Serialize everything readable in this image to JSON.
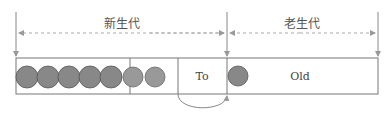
{
  "diagram": {
    "regions": {
      "young": {
        "label": "新生代"
      },
      "old": {
        "label": "老生代"
      }
    },
    "cells": {
      "eden": {
        "label": "",
        "objects": 5
      },
      "from": {
        "label": "",
        "objects": 2
      },
      "to": {
        "label": "To",
        "objects": 0
      },
      "old": {
        "label": "Old",
        "objects": 1
      }
    },
    "colors": {
      "object_fill": "#888888",
      "object_fill_light": "#999999",
      "line": "#666666",
      "dashed": "#aaaaaa"
    },
    "arrows": [
      {
        "from": "to",
        "to": "old",
        "style": "curved"
      }
    ]
  }
}
